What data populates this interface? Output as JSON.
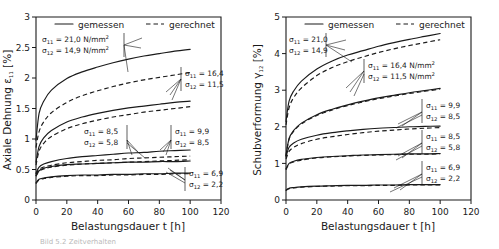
{
  "figure": {
    "caption": "Bild 5.2  Zeitverhalten"
  },
  "legend": {
    "measured_label": "gemessen",
    "computed_label": "gerechnet"
  },
  "symbols": {
    "sigma": "σ",
    "sub_11": "11",
    "sub_12": "12",
    "equals": "=",
    "unit": "N/mm",
    "unit_exp": "2"
  },
  "left": {
    "ylabel_text": "Axiale Dehnung",
    "ylabel_sym": "ε",
    "ylabel_sub": "11",
    "ylabel_unit": "[%]",
    "xlabel": "Belastungsdauer t [h]",
    "yticks": [
      "0",
      "0.5",
      "1",
      "1.5",
      "2",
      "2.5",
      "3"
    ],
    "xticks": [
      "0",
      "20",
      "40",
      "60",
      "80",
      "100",
      "120"
    ],
    "annotations": [
      {
        "s11": "21,0",
        "s12": "14,9",
        "units": true
      },
      {
        "s11": "16,4",
        "s12": "11,5",
        "units": false
      },
      {
        "s11": "8,5",
        "s12": "5,8",
        "units": false
      },
      {
        "s11": "9,9",
        "s12": "8,5",
        "units": false
      },
      {
        "s11": "6,9",
        "s12": "2,2",
        "units": false
      }
    ]
  },
  "right": {
    "ylabel_text": "Schubverformung",
    "ylabel_sym": "γ",
    "ylabel_sub": "12",
    "ylabel_unit": "[%]",
    "xlabel": "Belastungsdauer t [h]",
    "yticks": [
      "0",
      "1",
      "2",
      "3",
      "4",
      "5"
    ],
    "xticks": [
      "0",
      "20",
      "40",
      "60",
      "80",
      "100",
      "120"
    ],
    "annotations": [
      {
        "s11": "21,0",
        "s12": "14,9",
        "units": false
      },
      {
        "s11": "16,4",
        "s12": "11,5",
        "units": true
      },
      {
        "s11": "9,9",
        "s12": "8,5",
        "units": false
      },
      {
        "s11": "8,5",
        "s12": "5,8",
        "units": false
      },
      {
        "s11": "6,9",
        "s12": "2,2",
        "units": false
      }
    ]
  },
  "chart_data": {
    "type": "line",
    "panels": [
      {
        "id": "axial-strain",
        "title": "Axiale Dehnung ε₁₁ [%]",
        "xlabel": "Belastungsdauer t [h]",
        "ylabel": "Axiale Dehnung ε₁₁ [%]",
        "xlim": [
          0,
          120
        ],
        "ylim": [
          0,
          3
        ],
        "xticks": [
          0,
          20,
          40,
          60,
          80,
          100,
          120
        ],
        "yticks": [
          0,
          0.5,
          1,
          1.5,
          2,
          2.5,
          3
        ],
        "grid": false,
        "legend": [
          "gemessen",
          "gerechnet"
        ],
        "legend_position": "top-inside",
        "x": [
          0,
          2,
          5,
          10,
          20,
          30,
          40,
          50,
          60,
          70,
          80,
          90,
          100
        ],
        "series": [
          {
            "name": "gemessen σ11=21,0 σ12=14,9",
            "style": "solid",
            "values": [
              0.98,
              1.42,
              1.62,
              1.8,
              1.99,
              2.1,
              2.18,
              2.25,
              2.31,
              2.36,
              2.4,
              2.44,
              2.47
            ]
          },
          {
            "name": "gerechnet σ11=21,0 σ12=14,9",
            "style": "dashed",
            "values": [
              0.86,
              1.12,
              1.28,
              1.43,
              1.6,
              1.71,
              1.79,
              1.86,
              1.92,
              1.97,
              2.01,
              2.05,
              2.09
            ]
          },
          {
            "name": "gemessen σ11=16,4 σ12=11,5",
            "style": "solid",
            "values": [
              0.62,
              0.88,
              1.02,
              1.14,
              1.28,
              1.36,
              1.42,
              1.47,
              1.51,
              1.54,
              1.57,
              1.6,
              1.62
            ]
          },
          {
            "name": "gerechnet σ11=16,4 σ12=11,5",
            "style": "dashed",
            "values": [
              0.57,
              0.8,
              0.93,
              1.04,
              1.17,
              1.25,
              1.31,
              1.36,
              1.4,
              1.44,
              1.47,
              1.5,
              1.53
            ]
          },
          {
            "name": "gemessen σ11=9,9 σ12=8,5",
            "style": "solid",
            "values": [
              0.44,
              0.54,
              0.59,
              0.63,
              0.68,
              0.71,
              0.73,
              0.75,
              0.77,
              0.78,
              0.8,
              0.81,
              0.82
            ]
          },
          {
            "name": "gerechnet σ11=9,9 σ12=8,5",
            "style": "dashed",
            "values": [
              0.42,
              0.5,
              0.54,
              0.57,
              0.61,
              0.63,
              0.65,
              0.66,
              0.68,
              0.69,
              0.7,
              0.71,
              0.72
            ]
          },
          {
            "name": "gemessen σ11=8,5 σ12=5,8",
            "style": "solid",
            "values": [
              0.4,
              0.48,
              0.52,
              0.55,
              0.58,
              0.59,
              0.6,
              0.61,
              0.62,
              0.62,
              0.63,
              0.63,
              0.64
            ]
          },
          {
            "name": "gerechnet σ11=8,5 σ12=5,8",
            "style": "dashed",
            "values": [
              0.39,
              0.47,
              0.51,
              0.54,
              0.57,
              0.59,
              0.6,
              0.61,
              0.62,
              0.63,
              0.64,
              0.65,
              0.66
            ]
          },
          {
            "name": "gemessen σ11=6,9 σ12=2,2",
            "style": "solid",
            "values": [
              0.28,
              0.34,
              0.36,
              0.38,
              0.4,
              0.41,
              0.41,
              0.42,
              0.42,
              0.43,
              0.43,
              0.44,
              0.44
            ]
          },
          {
            "name": "gerechnet σ11=6,9 σ12=2,2",
            "style": "dashed",
            "values": [
              0.27,
              0.33,
              0.35,
              0.37,
              0.39,
              0.4,
              0.4,
              0.41,
              0.41,
              0.42,
              0.42,
              0.43,
              0.43
            ]
          }
        ]
      },
      {
        "id": "shear-strain",
        "title": "Schubverformung γ₁₂ [%]",
        "xlabel": "Belastungsdauer t [h]",
        "ylabel": "Schubverformung γ₁₂ [%]",
        "xlim": [
          0,
          120
        ],
        "ylim": [
          0,
          5
        ],
        "xticks": [
          0,
          20,
          40,
          60,
          80,
          100,
          120
        ],
        "yticks": [
          0,
          1,
          2,
          3,
          4,
          5
        ],
        "grid": false,
        "legend": [
          "gemessen",
          "gerechnet"
        ],
        "legend_position": "top-inside",
        "x": [
          0,
          2,
          5,
          10,
          20,
          30,
          40,
          50,
          60,
          70,
          80,
          90,
          100
        ],
        "series": [
          {
            "name": "gemessen σ11=21,0 σ12=14,9",
            "style": "solid",
            "values": [
              2.15,
              2.7,
              2.98,
              3.25,
              3.58,
              3.8,
              3.96,
              4.08,
              4.2,
              4.3,
              4.39,
              4.47,
              4.55
            ]
          },
          {
            "name": "gerechnet σ11=21,0 σ12=14,9",
            "style": "dashed",
            "values": [
              2.05,
              2.52,
              2.8,
              3.06,
              3.4,
              3.62,
              3.78,
              3.91,
              4.03,
              4.13,
              4.22,
              4.3,
              4.38
            ]
          },
          {
            "name": "gemessen σ11=16,4 σ12=11,5",
            "style": "solid",
            "values": [
              1.22,
              1.68,
              1.9,
              2.1,
              2.33,
              2.48,
              2.6,
              2.7,
              2.79,
              2.86,
              2.93,
              2.99,
              3.05
            ]
          },
          {
            "name": "gerechnet σ11=16,4 σ12=11,5",
            "style": "dashed",
            "values": [
              1.2,
              1.66,
              1.88,
              2.08,
              2.31,
              2.46,
              2.58,
              2.68,
              2.77,
              2.84,
              2.91,
              2.97,
              3.03
            ]
          },
          {
            "name": "gemessen σ11=9,9 σ12=8,5",
            "style": "solid",
            "values": [
              1.18,
              1.44,
              1.56,
              1.66,
              1.77,
              1.84,
              1.89,
              1.93,
              1.96,
              1.98,
              2.0,
              2.01,
              2.02
            ]
          },
          {
            "name": "gerechnet σ11=9,9 σ12=8,5",
            "style": "dashed",
            "values": [
              1.12,
              1.33,
              1.44,
              1.54,
              1.66,
              1.73,
              1.79,
              1.84,
              1.88,
              1.91,
              1.94,
              1.96,
              1.98
            ]
          },
          {
            "name": "gemessen σ11=8,5 σ12=5,8",
            "style": "solid",
            "values": [
              0.85,
              1.0,
              1.06,
              1.11,
              1.16,
              1.19,
              1.21,
              1.23,
              1.24,
              1.25,
              1.26,
              1.26,
              1.27
            ]
          },
          {
            "name": "gerechnet σ11=8,5 σ12=5,8",
            "style": "dashed",
            "values": [
              0.83,
              0.98,
              1.04,
              1.09,
              1.15,
              1.18,
              1.2,
              1.22,
              1.23,
              1.24,
              1.25,
              1.25,
              1.26
            ]
          },
          {
            "name": "gemessen σ11=6,9 σ12=2,2",
            "style": "solid",
            "values": [
              0.27,
              0.32,
              0.34,
              0.36,
              0.38,
              0.39,
              0.4,
              0.4,
              0.41,
              0.41,
              0.42,
              0.42,
              0.42
            ]
          },
          {
            "name": "gerechnet σ11=6,9 σ12=2,2",
            "style": "dashed",
            "values": [
              0.26,
              0.31,
              0.33,
              0.35,
              0.37,
              0.38,
              0.39,
              0.39,
              0.4,
              0.4,
              0.41,
              0.41,
              0.41
            ]
          }
        ]
      }
    ]
  }
}
